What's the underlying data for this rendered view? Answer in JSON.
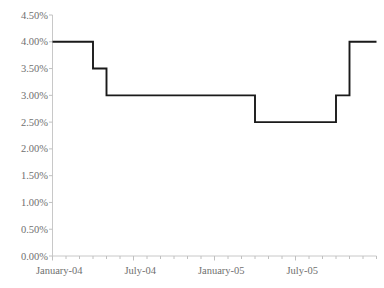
{
  "chart_data": {
    "type": "line",
    "title": "",
    "subtitle": "",
    "xlabel": "",
    "ylabel": "",
    "step": "post",
    "grid": false,
    "legend": null,
    "line_color": "#1a1a1a",
    "axis_color": "#c8c8c8",
    "tick_color": "#c0c0c0",
    "label_color": "#6f6f6f",
    "background": "#ffffff",
    "ylim": [
      0,
      4.5
    ],
    "ytick_values": [
      4.5,
      4.0,
      3.5,
      3.0,
      2.5,
      2.0,
      1.5,
      1.0,
      0.5,
      0.0
    ],
    "ytick_labels": [
      "4.50%",
      "4.00%",
      "3.50%",
      "3.00%",
      "2.50%",
      "2.00%",
      "1.50%",
      "1.00%",
      "0.50%",
      "0.00%"
    ],
    "xtick_labels": [
      "January-04",
      "July-04",
      "January-05",
      "July-05"
    ],
    "xtick_label_indices": [
      0,
      6,
      12,
      18
    ],
    "x": [
      "January-04",
      "February-04",
      "March-04",
      "April-04",
      "May-04",
      "June-04",
      "July-04",
      "August-04",
      "September-04",
      "October-04",
      "November-04",
      "December-04",
      "January-05",
      "February-05",
      "March-05",
      "April-05",
      "May-05",
      "June-05",
      "July-05",
      "August-05",
      "September-05",
      "October-05",
      "November-05",
      "December-05"
    ],
    "values": [
      4.0,
      4.0,
      4.0,
      3.5,
      3.0,
      3.0,
      3.0,
      3.0,
      3.0,
      3.0,
      3.0,
      3.0,
      3.0,
      3.0,
      3.0,
      2.5,
      2.5,
      2.5,
      2.5,
      2.5,
      2.5,
      3.0,
      4.0,
      4.0
    ],
    "series": [
      {
        "name": "Rate",
        "values": [
          4.0,
          4.0,
          4.0,
          3.5,
          3.0,
          3.0,
          3.0,
          3.0,
          3.0,
          3.0,
          3.0,
          3.0,
          3.0,
          3.0,
          3.0,
          2.5,
          2.5,
          2.5,
          2.5,
          2.5,
          2.5,
          3.0,
          4.0,
          4.0
        ]
      }
    ],
    "annotations": []
  }
}
